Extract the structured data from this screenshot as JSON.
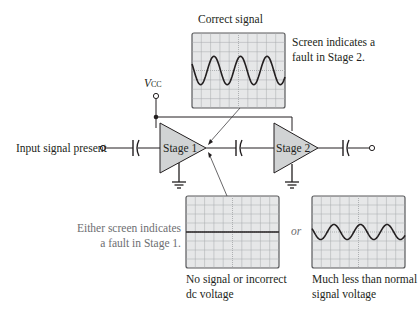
{
  "title_correct": "Correct signal",
  "note_stage2": [
    "Screen indicates a",
    "fault in Stage 2."
  ],
  "note_stage1": [
    "Either screen indicates",
    "a fault in Stage 1."
  ],
  "vcc_label": {
    "main": "V",
    "sub": "CC"
  },
  "input_label": "Input signal present",
  "stage1_label": "Stage 1",
  "stage2_label": "Stage 2",
  "or_label": "or",
  "caption_no_signal": [
    "No signal or incorrect",
    "dc voltage"
  ],
  "caption_low_signal": [
    "Much less than normal",
    "signal voltage"
  ],
  "screens": {
    "correct": {
      "waveform": "sine",
      "cycles": 3.5,
      "relative_amplitude": 1.0
    },
    "no_signal": {
      "waveform": "flat",
      "relative_amplitude": 0
    },
    "low_signal": {
      "waveform": "sine",
      "cycles": 3.5,
      "relative_amplitude": 0.55
    }
  },
  "colors": {
    "screen_bg": "#e6e7e8",
    "grid": "#a7a9ac",
    "stage_fill": "#d1d3d4",
    "line": "#231f20",
    "note_gray": "#6d6e71"
  }
}
